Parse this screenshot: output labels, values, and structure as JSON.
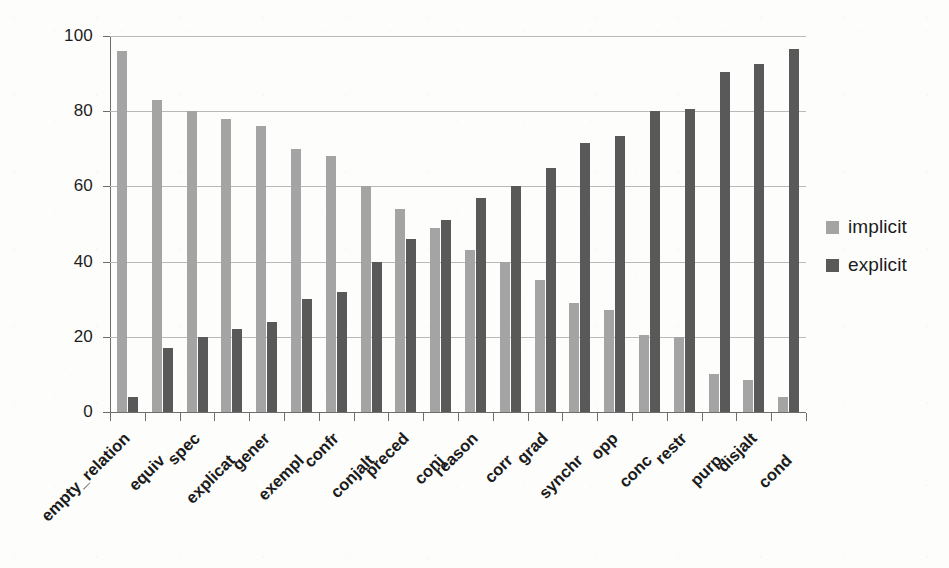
{
  "chart_data": {
    "type": "bar",
    "title": "",
    "subtitle": "",
    "xlabel": "",
    "ylabel": "",
    "ylim": [
      0,
      100
    ],
    "yticks": [
      0,
      20,
      40,
      60,
      80,
      100
    ],
    "grid": true,
    "orientation": "vertical",
    "grouping": "grouped",
    "legend_position": "right",
    "categories": [
      "empty_relation",
      "equiv",
      "spec",
      "explicat",
      "gener",
      "exempl",
      "confr",
      "conjalt",
      "preced",
      "conj",
      "reason",
      "corr",
      "grad",
      "synchr",
      "opp",
      "conc",
      "restr",
      "purp",
      "disjalt",
      "cond"
    ],
    "series": [
      {
        "name": "implicit",
        "color": "#a4a4a4",
        "values": [
          96,
          83,
          80,
          78,
          76,
          70,
          68,
          60,
          54,
          49,
          43,
          40,
          35,
          29,
          27,
          20.5,
          20,
          10,
          8.5,
          4
        ]
      },
      {
        "name": "explicit",
        "color": "#595959",
        "values": [
          4,
          17,
          20,
          22,
          24,
          30,
          32,
          40,
          46,
          51,
          57,
          60,
          65,
          71.5,
          73.5,
          80,
          80.5,
          90.5,
          92.5,
          96.5
        ]
      }
    ]
  },
  "legend": {
    "items": [
      {
        "label": "implicit",
        "color": "#a4a4a4"
      },
      {
        "label": "explicit",
        "color": "#595959"
      }
    ]
  },
  "axis": {
    "y_tick_labels": [
      "100",
      "80",
      "60",
      "40",
      "20",
      "0"
    ]
  }
}
